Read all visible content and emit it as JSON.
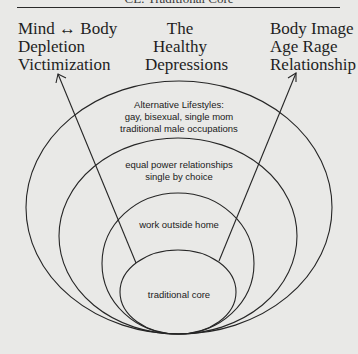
{
  "header": {
    "cut_title": "CE: Traditional Core"
  },
  "top_columns": {
    "left": [
      "Mind ↔ Body",
      "Depletion",
      "Victimization"
    ],
    "middle": [
      "The",
      "Healthy",
      "Depressions"
    ],
    "right": [
      "Body Image",
      "Age Rage",
      "Relationship"
    ]
  },
  "rings": [
    {
      "name": "outer",
      "lines": [
        "Alternative Lifestyles:",
        "gay, bisexual, single mom",
        "traditional male occupations"
      ]
    },
    {
      "name": "second",
      "lines": [
        "equal power relationships",
        "single by choice"
      ]
    },
    {
      "name": "third",
      "lines": [
        "work outside home"
      ]
    },
    {
      "name": "core",
      "lines": [
        "traditional core"
      ]
    }
  ],
  "arrows": [
    {
      "from": "traditional core",
      "to": "left column"
    },
    {
      "from": "traditional core",
      "to": "right column"
    }
  ],
  "colors": {
    "background": "#e9e9e7",
    "ink": "#1e1e1e"
  }
}
